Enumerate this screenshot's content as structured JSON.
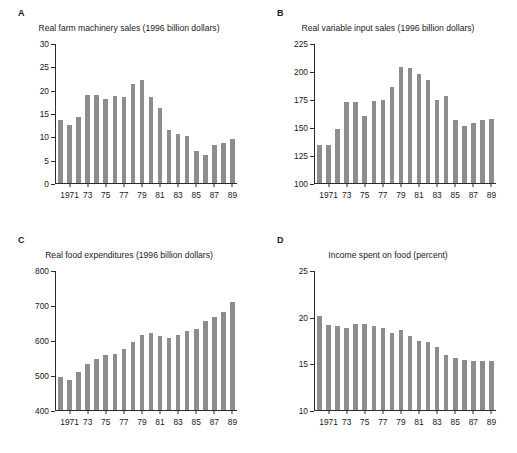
{
  "figure": {
    "background": "#ffffff",
    "bar_color": "#8d8d8d",
    "axis_color": "#2b2b2b"
  },
  "panels": [
    {
      "letter": "A",
      "title": "Real farm machinery sales (1996 billion dollars)",
      "chart_data": {
        "type": "bar",
        "title": "Real farm machinery sales (1996 billion dollars)",
        "xlabel": "",
        "ylabel": "",
        "ylim": [
          0,
          30
        ],
        "yticks": [
          0,
          5,
          10,
          15,
          20,
          25,
          30
        ],
        "grid": false,
        "legend": false,
        "categories": [
          1970,
          1971,
          1972,
          1973,
          1974,
          1975,
          1976,
          1977,
          1978,
          1979,
          1980,
          1981,
          1982,
          1983,
          1984,
          1985,
          1986,
          1987,
          1988,
          1989
        ],
        "xtick_labels": [
          "",
          "1971",
          "",
          "73",
          "",
          "75",
          "",
          "77",
          "",
          "79",
          "",
          "81",
          "",
          "83",
          "",
          "85",
          "",
          "87",
          "",
          "89"
        ],
        "values": [
          13.5,
          12.5,
          14.3,
          19.1,
          19.0,
          18.1,
          18.8,
          18.6,
          21.4,
          22.2,
          18.5,
          16.2,
          11.5,
          10.6,
          10.2,
          6.9,
          6.1,
          8.3,
          8.7,
          9.5
        ]
      }
    },
    {
      "letter": "B",
      "title": "Real variable input sales (1996 billion dollars)",
      "chart_data": {
        "type": "bar",
        "title": "Real variable input sales (1996 billion dollars)",
        "xlabel": "",
        "ylabel": "",
        "ylim": [
          100,
          225
        ],
        "yticks": [
          100,
          125,
          150,
          175,
          200,
          225
        ],
        "grid": false,
        "legend": false,
        "categories": [
          1970,
          1971,
          1972,
          1973,
          1974,
          1975,
          1976,
          1977,
          1978,
          1979,
          1980,
          1981,
          1982,
          1983,
          1984,
          1985,
          1986,
          1987,
          1988,
          1989
        ],
        "xtick_labels": [
          "",
          "1971",
          "",
          "73",
          "",
          "75",
          "",
          "77",
          "",
          "79",
          "",
          "81",
          "",
          "83",
          "",
          "85",
          "",
          "87",
          "",
          "89"
        ],
        "values": [
          134,
          134,
          149,
          173,
          173,
          160,
          174,
          175,
          186,
          204,
          203,
          198,
          193,
          175,
          178,
          157,
          151,
          154,
          157,
          158
        ]
      }
    },
    {
      "letter": "C",
      "title": "Real food expenditures (1996 billion dollars)",
      "chart_data": {
        "type": "bar",
        "title": "Real food expenditures (1996 billion dollars)",
        "xlabel": "",
        "ylabel": "",
        "ylim": [
          400,
          800
        ],
        "yticks": [
          400,
          500,
          600,
          700,
          800
        ],
        "grid": false,
        "legend": false,
        "categories": [
          1970,
          1971,
          1972,
          1973,
          1974,
          1975,
          1976,
          1977,
          1978,
          1979,
          1980,
          1981,
          1982,
          1983,
          1984,
          1985,
          1986,
          1987,
          1988,
          1989
        ],
        "xtick_labels": [
          "",
          "1971",
          "",
          "73",
          "",
          "75",
          "",
          "77",
          "",
          "79",
          "",
          "81",
          "",
          "83",
          "",
          "85",
          "",
          "87",
          "",
          "89"
        ],
        "values": [
          494,
          486,
          510,
          531,
          548,
          558,
          561,
          576,
          597,
          617,
          622,
          614,
          608,
          617,
          627,
          633,
          656,
          667,
          682,
          711
        ]
      }
    },
    {
      "letter": "D",
      "title": "Income spent on food (percent)",
      "chart_data": {
        "type": "bar",
        "title": "Income spent on food (percent)",
        "xlabel": "",
        "ylabel": "",
        "ylim": [
          10,
          25
        ],
        "yticks": [
          10,
          15,
          20,
          25
        ],
        "grid": false,
        "legend": false,
        "categories": [
          1970,
          1971,
          1972,
          1973,
          1974,
          1975,
          1976,
          1977,
          1978,
          1979,
          1980,
          1981,
          1982,
          1983,
          1984,
          1985,
          1986,
          1987,
          1988,
          1989
        ],
        "xtick_labels": [
          "",
          "1971",
          "",
          "73",
          "",
          "75",
          "",
          "77",
          "",
          "79",
          "",
          "81",
          "",
          "83",
          "",
          "85",
          "",
          "87",
          "",
          "89"
        ],
        "values": [
          20.1,
          19.2,
          19.1,
          18.8,
          19.3,
          19.3,
          19.1,
          18.9,
          18.3,
          18.6,
          18.0,
          17.5,
          17.3,
          16.8,
          15.9,
          15.6,
          15.4,
          15.3,
          15.3,
          15.3
        ]
      }
    }
  ]
}
